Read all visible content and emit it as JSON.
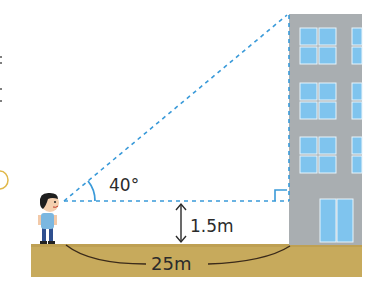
{
  "diagram": {
    "type": "angle-of-elevation",
    "angle_label": "40°",
    "eye_height_label": "1.5m",
    "distance_label": "25m",
    "colors": {
      "dashed_line": "#3a9ad9",
      "building": "#a9aeb1",
      "window": "#7fc4ee",
      "window_frame": "#e8f4fb",
      "ground": "#c7aa5c",
      "text": "#2b2b2b",
      "margin_mark": "#e0b84a"
    },
    "elements": [
      "boy",
      "building",
      "ground",
      "sight-line",
      "horizontal-line",
      "right-angle-mark",
      "height-arrow",
      "distance-arc"
    ]
  }
}
